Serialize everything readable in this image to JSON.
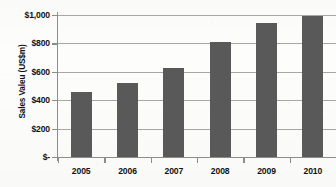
{
  "chart_data": {
    "type": "bar",
    "title": "",
    "xlabel": "",
    "ylabel": "Sales Valeu (US$m)",
    "categories": [
      "2005",
      "2006",
      "2007",
      "2008",
      "2009",
      "2010"
    ],
    "values": [
      460,
      520,
      625,
      810,
      945,
      995
    ],
    "ylim": [
      0,
      1000
    ],
    "ytick_values": [
      0,
      200,
      400,
      600,
      800,
      1000
    ],
    "ytick_labels": [
      "$-",
      "$200",
      "$400",
      "$600",
      "$800",
      "$1,000"
    ],
    "grid": true,
    "legend": false,
    "series": [
      {
        "name": "Sales Value",
        "values": [
          460,
          520,
          625,
          810,
          945,
          995
        ],
        "color": "#595959"
      }
    ]
  },
  "style": {
    "bar_color": "#595959",
    "gridline_color": "#a6a6a6",
    "axis_color": "#8c8c8c",
    "text_color": "#111111",
    "background": "#fdfdfc"
  }
}
